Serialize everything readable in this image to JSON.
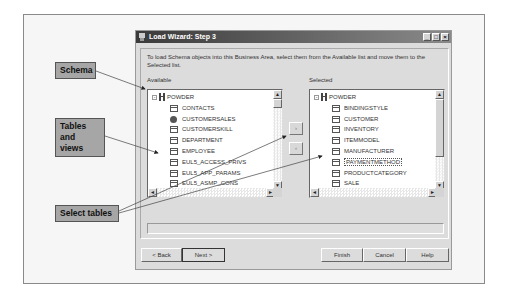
{
  "window": {
    "title": "Load Wizard: Step 3",
    "controls": [
      "minimize",
      "maximize",
      "close"
    ]
  },
  "intro_text": "To load Schema objects into this Business Area, select them from the Available list and move them to the Selected list.",
  "available": {
    "label": "Available",
    "root": "POWDER",
    "items": [
      {
        "name": "CONTACTS",
        "type": "table"
      },
      {
        "name": "CUSTOMERSALES",
        "type": "view"
      },
      {
        "name": "CUSTOMERSKILL",
        "type": "table"
      },
      {
        "name": "DEPARTMENT",
        "type": "table"
      },
      {
        "name": "EMPLOYEE",
        "type": "table"
      },
      {
        "name": "EUL5_ACCESS_PRIVS",
        "type": "table"
      },
      {
        "name": "EUL5_APP_PARAMS",
        "type": "table"
      },
      {
        "name": "EUL5_ASMP_CONS",
        "type": "table"
      }
    ]
  },
  "selected": {
    "label": "Selected",
    "root": "POWDER",
    "items": [
      {
        "name": "BINDINGSTYLE",
        "type": "table"
      },
      {
        "name": "CUSTOMER",
        "type": "table"
      },
      {
        "name": "INVENTORY",
        "type": "table"
      },
      {
        "name": "ITEMMODEL",
        "type": "table"
      },
      {
        "name": "MANUFACTURER",
        "type": "table"
      },
      {
        "name": "PAYMENTMETHOD",
        "type": "table",
        "focused": true
      },
      {
        "name": "PRODUCTCATEGORY",
        "type": "table"
      },
      {
        "name": "SALE",
        "type": "table"
      }
    ]
  },
  "move_buttons": {
    "add": "›",
    "remove": "‹"
  },
  "buttons": {
    "back": "< Back",
    "next": "Next >",
    "finish": "Finish",
    "cancel": "Cancel",
    "help": "Help"
  },
  "callouts": {
    "schema": "Schema",
    "tables_views_1": "Tables",
    "tables_views_2": "and views",
    "select_tables": "Select tables"
  },
  "colors": {
    "titlebar": "#3a3a3a",
    "dialog_bg": "#dcdcdc",
    "callout_bg": "#a6a6a6"
  }
}
